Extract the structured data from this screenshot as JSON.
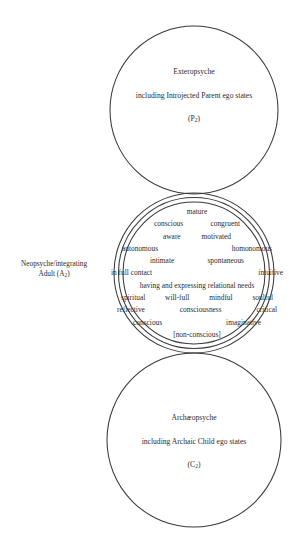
{
  "diagram": {
    "stroke_color": "#3a3a3a",
    "background_color": "#ffffff",
    "text_color": "#2b2b2b"
  },
  "exteropsyche": {
    "name": "Exteropsyche",
    "description": "including Introjected Parent ego states",
    "symbol_prefix": "(P",
    "symbol_subscript": "2",
    "symbol_suffix": ")"
  },
  "neopsyche": {
    "label_line1": "Neopsyche/integrating",
    "label_line2_prefix": "Adult (A",
    "label_line2_subscript": "2",
    "label_line2_suffix": ")",
    "word_lines": [
      {
        "words": [
          "mature"
        ]
      },
      {
        "words": [
          "conscious",
          "congruent"
        ]
      },
      {
        "words": [
          "aware",
          "motivated"
        ]
      },
      {
        "words": [
          "autonomous",
          "homonomous"
        ]
      },
      {
        "words": [
          "intimate",
          "spontaneous"
        ]
      },
      {
        "words": [
          "in full contact",
          "intuitive"
        ]
      },
      {
        "words": [
          "having and expressing relational needs"
        ]
      },
      {
        "words": [
          "spiritual",
          "will-full",
          "mindful",
          "soulful"
        ]
      },
      {
        "words": [
          "reflective",
          "consciousness",
          "critical"
        ]
      },
      {
        "words": [
          "conscious",
          "imaginative"
        ]
      },
      {
        "words": [
          "[non-conscious]"
        ]
      }
    ]
  },
  "archaeopsyche": {
    "name": "Archæopsyche",
    "description": "including Archaic Child ego states",
    "symbol_prefix": "(C",
    "symbol_subscript": "2",
    "symbol_suffix": ")"
  }
}
